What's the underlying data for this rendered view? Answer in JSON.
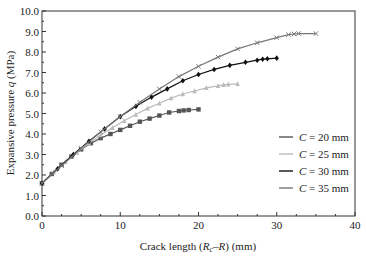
{
  "chart_data": {
    "type": "line",
    "title": "",
    "xlabel": "Crack length (R_c–R) (mm)",
    "ylabel": "Expansive pressure q (MPa)",
    "xlim": [
      0,
      40
    ],
    "ylim": [
      0,
      10
    ],
    "x_ticks": [
      "0",
      "10",
      "20",
      "30",
      "40"
    ],
    "y_ticks": [
      "0.0",
      "1.0",
      "2.0",
      "3.0",
      "4.0",
      "5.0",
      "6.0",
      "7.0",
      "8.0",
      "9.0",
      "10.0"
    ],
    "grid": false,
    "legend_position": "lower right",
    "series": [
      {
        "name": "C = 20 mm",
        "color": "#555555",
        "marker": "square",
        "x": [
          0,
          1.25,
          2.5,
          3.75,
          5,
          6.25,
          7.5,
          8.75,
          10,
          11.25,
          12.5,
          13.75,
          15,
          16.25,
          17.5,
          18.1,
          18.75,
          20
        ],
        "y": [
          1.6,
          2.05,
          2.5,
          2.9,
          3.25,
          3.55,
          3.8,
          4.0,
          4.2,
          4.4,
          4.6,
          4.75,
          4.9,
          5.05,
          5.12,
          5.15,
          5.17,
          5.2
        ]
      },
      {
        "name": "C = 25 mm",
        "color": "#bbbbbb",
        "marker": "triangle",
        "x": [
          0,
          1.5,
          3,
          4.5,
          6,
          7.5,
          9,
          10.5,
          12,
          13.5,
          15,
          16.5,
          18,
          19.5,
          21,
          22.5,
          23.2,
          23.8,
          25
        ],
        "y": [
          1.6,
          2.15,
          2.65,
          3.1,
          3.55,
          3.95,
          4.3,
          4.65,
          4.95,
          5.25,
          5.5,
          5.75,
          5.95,
          6.1,
          6.25,
          6.35,
          6.4,
          6.42,
          6.45
        ]
      },
      {
        "name": "C = 30 mm",
        "color": "#111111",
        "marker": "diamond",
        "x": [
          0,
          2,
          4,
          6,
          8,
          10,
          12,
          14,
          16,
          18,
          20,
          22,
          24,
          26,
          27.5,
          28.2,
          28.8,
          30
        ],
        "y": [
          1.6,
          2.3,
          3.0,
          3.65,
          4.25,
          4.85,
          5.35,
          5.8,
          6.2,
          6.6,
          6.9,
          7.15,
          7.35,
          7.5,
          7.6,
          7.65,
          7.67,
          7.7
        ]
      },
      {
        "name": "C = 35 mm",
        "color": "#777777",
        "marker": "x",
        "x": [
          0,
          2.5,
          5,
          7.5,
          10,
          12.5,
          15,
          17.5,
          20,
          22.5,
          25,
          27.5,
          30,
          31.5,
          32.2,
          32.8,
          35
        ],
        "y": [
          1.6,
          2.45,
          3.3,
          4.1,
          4.85,
          5.55,
          6.2,
          6.8,
          7.3,
          7.75,
          8.15,
          8.45,
          8.7,
          8.85,
          8.88,
          8.9,
          8.9
        ]
      }
    ]
  },
  "legend": {
    "items": [
      {
        "label": "C = 20 mm",
        "color": "#555555"
      },
      {
        "label": "C = 25 mm",
        "color": "#bbbbbb"
      },
      {
        "label": "C = 30 mm",
        "color": "#111111"
      },
      {
        "label": "C = 35 mm",
        "color": "#777777"
      }
    ]
  }
}
